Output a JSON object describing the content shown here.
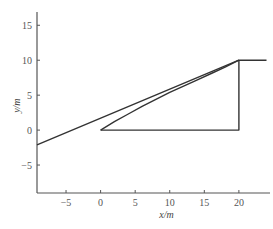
{
  "chart_data": {
    "type": "line",
    "title": "",
    "xlabel": "x/m",
    "ylabel": "y/m",
    "xlim": [
      -9.2,
      24.5
    ],
    "ylim": [
      -9,
      16.9
    ],
    "xticks": [
      -5,
      0,
      5,
      10,
      15,
      20
    ],
    "yticks": [
      -5,
      0,
      5,
      10,
      15
    ],
    "xtick_labels": [
      "−5",
      "0",
      "5",
      "10",
      "15",
      "20"
    ],
    "ytick_labels": [
      "−5",
      "0",
      "5",
      "10",
      "15"
    ],
    "grid": false,
    "legend": null,
    "series": [
      {
        "name": "straight-line",
        "style": "solid",
        "points": [
          [
            -9.2,
            -2.1
          ],
          [
            20,
            10
          ],
          [
            24,
            10
          ]
        ]
      },
      {
        "name": "triangle",
        "style": "solid",
        "points": [
          [
            0,
            0
          ],
          [
            20,
            0
          ],
          [
            20,
            10
          ]
        ]
      },
      {
        "name": "curved-hypotenuse",
        "style": "solid",
        "points": [
          [
            0,
            0
          ],
          [
            2,
            1.2
          ],
          [
            4,
            2.3
          ],
          [
            6,
            3.4
          ],
          [
            8,
            4.4
          ],
          [
            10,
            5.4
          ],
          [
            12,
            6.3
          ],
          [
            14,
            7.2
          ],
          [
            16,
            8.1
          ],
          [
            18,
            9.0
          ],
          [
            20,
            10
          ]
        ]
      }
    ],
    "colors": {
      "line": "#333333",
      "axis": "#555555"
    }
  }
}
